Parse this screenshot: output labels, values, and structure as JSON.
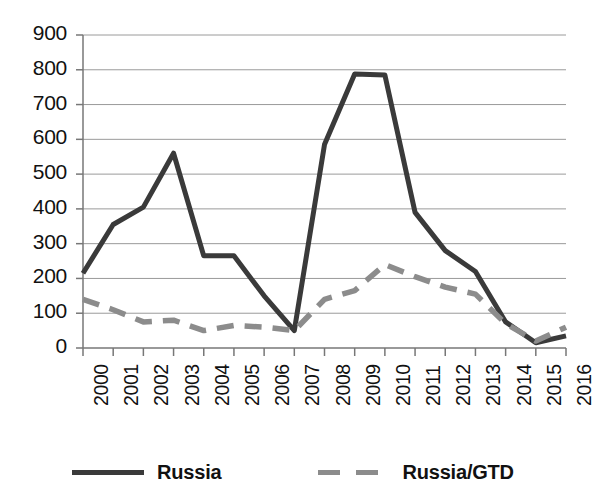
{
  "chart_data": {
    "type": "line",
    "title": "",
    "xlabel": "",
    "ylabel": "",
    "categories": [
      "2000",
      "2001",
      "2002",
      "2003",
      "2004",
      "2005",
      "2006",
      "2007",
      "2008",
      "2009",
      "2010",
      "2011",
      "2012",
      "2013",
      "2014",
      "2015",
      "2016"
    ],
    "ylim": [
      0,
      900
    ],
    "ytick_labels": [
      "900",
      "800",
      "700",
      "600",
      "500",
      "400",
      "300",
      "200",
      "100",
      "0"
    ],
    "ytick_values": [
      900,
      800,
      700,
      600,
      500,
      400,
      300,
      200,
      100,
      0
    ],
    "grid": true,
    "legend_position": "bottom",
    "series": [
      {
        "name": "Russia",
        "style": "solid",
        "color": "#3a3a3a",
        "values": [
          215,
          355,
          405,
          560,
          265,
          265,
          150,
          50,
          585,
          788,
          785,
          390,
          280,
          220,
          75,
          15,
          35
        ]
      },
      {
        "name": "Russia/GTD",
        "style": "dashed",
        "color": "#8c8c8c",
        "values": [
          140,
          110,
          75,
          80,
          50,
          65,
          60,
          50,
          140,
          165,
          240,
          205,
          175,
          155,
          70,
          20,
          60
        ]
      }
    ]
  },
  "legend": {
    "entries": [
      {
        "label": "Russia",
        "swatch": "solid-line-swatch"
      },
      {
        "label": "Russia/GTD",
        "swatch": "dashed-line-swatch"
      }
    ]
  },
  "axes": {
    "x_axis_name": "year-axis",
    "y_axis_name": "value-axis"
  }
}
